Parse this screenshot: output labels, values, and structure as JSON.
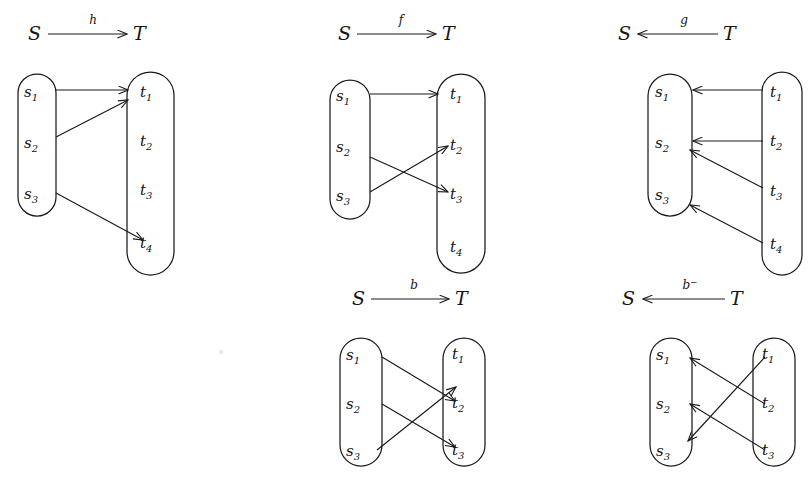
{
  "figure": {
    "background_color": "#ffffff",
    "ink_color": "#1a1a1a",
    "width": 810,
    "height": 494
  },
  "set_names": {
    "source": "S",
    "target": "T"
  },
  "panels": [
    {
      "id": "panel-h",
      "map_label": "h",
      "map_superscript": "",
      "direction": "right",
      "header": {
        "left": "S",
        "right": "T"
      },
      "source_elements": [
        "s",
        "s",
        "s"
      ],
      "source_subscripts": [
        "1",
        "2",
        "3"
      ],
      "target_elements": [
        "t",
        "t",
        "t",
        "t"
      ],
      "target_subscripts": [
        "1",
        "2",
        "3",
        "4"
      ],
      "edges": [
        {
          "from": "s1",
          "to": "t1"
        },
        {
          "from": "s2",
          "to": "t1"
        },
        {
          "from": "s3",
          "to": "t4"
        }
      ]
    },
    {
      "id": "panel-f",
      "map_label": "f",
      "map_superscript": "",
      "direction": "right",
      "header": {
        "left": "S",
        "right": "T"
      },
      "source_elements": [
        "s",
        "s",
        "s"
      ],
      "source_subscripts": [
        "1",
        "2",
        "3"
      ],
      "target_elements": [
        "t",
        "t",
        "t",
        "t"
      ],
      "target_subscripts": [
        "1",
        "2",
        "3",
        "4"
      ],
      "edges": [
        {
          "from": "s1",
          "to": "t1"
        },
        {
          "from": "s2",
          "to": "t3"
        },
        {
          "from": "s3",
          "to": "t2"
        }
      ]
    },
    {
      "id": "panel-g",
      "map_label": "g",
      "map_superscript": "",
      "direction": "left",
      "header": {
        "left": "S",
        "right": "T"
      },
      "source_elements": [
        "s",
        "s",
        "s"
      ],
      "source_subscripts": [
        "1",
        "2",
        "3"
      ],
      "target_elements": [
        "t",
        "t",
        "t",
        "t"
      ],
      "target_subscripts": [
        "1",
        "2",
        "3",
        "4"
      ],
      "edges": [
        {
          "from": "t1",
          "to": "s1"
        },
        {
          "from": "t2",
          "to": "s2"
        },
        {
          "from": "t3",
          "to": "s2"
        },
        {
          "from": "t4",
          "to": "s3"
        }
      ]
    },
    {
      "id": "panel-b",
      "map_label": "b",
      "map_superscript": "",
      "direction": "right",
      "header": {
        "left": "S",
        "right": "T"
      },
      "source_elements": [
        "s",
        "s",
        "s"
      ],
      "source_subscripts": [
        "1",
        "2",
        "3"
      ],
      "target_elements": [
        "t",
        "t",
        "t"
      ],
      "target_subscripts": [
        "1",
        "2",
        "3"
      ],
      "edges": [
        {
          "from": "s1",
          "to": "t2"
        },
        {
          "from": "s2",
          "to": "t3"
        },
        {
          "from": "s3",
          "to": "t1"
        }
      ]
    },
    {
      "id": "panel-b-inverse",
      "map_label": "b",
      "map_superscript": "−",
      "direction": "left",
      "header": {
        "left": "S",
        "right": "T"
      },
      "source_elements": [
        "s",
        "s",
        "s"
      ],
      "source_subscripts": [
        "1",
        "2",
        "3"
      ],
      "target_elements": [
        "t",
        "t",
        "t"
      ],
      "target_subscripts": [
        "1",
        "2",
        "3"
      ],
      "edges": [
        {
          "from": "t1",
          "to": "s3"
        },
        {
          "from": "t2",
          "to": "s1"
        },
        {
          "from": "t3",
          "to": "s2"
        }
      ]
    }
  ]
}
